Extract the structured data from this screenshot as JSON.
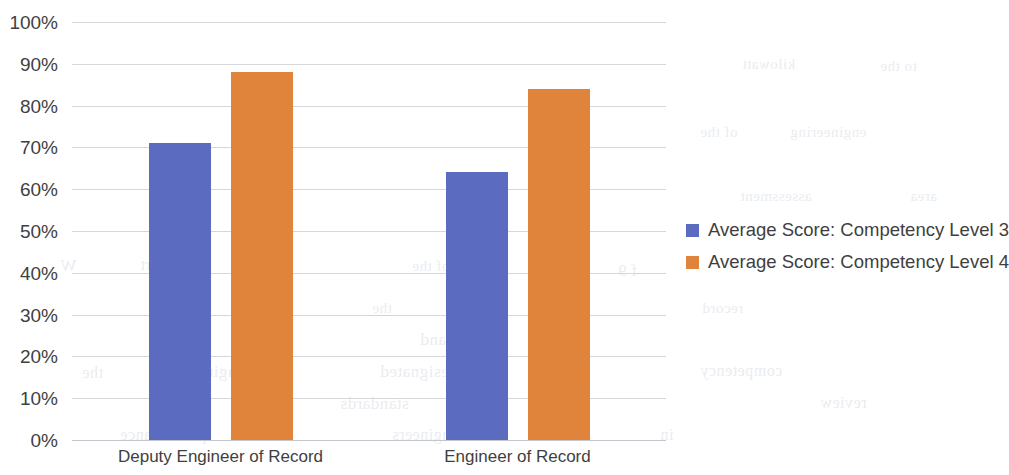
{
  "chart_data": {
    "type": "bar",
    "title": "",
    "subtitle": "",
    "xlabel": "",
    "ylabel": "",
    "categories": [
      "Deputy Engineer of Record",
      "Engineer of Record"
    ],
    "series": [
      {
        "name": "Average Score: Competency Level 3",
        "color": "#5b6bbf",
        "values": [
          71,
          64
        ]
      },
      {
        "name": "Average Score: Competency Level 4",
        "color": "#e0843b",
        "values": [
          88,
          84
        ]
      }
    ],
    "ylim": [
      0,
      100
    ],
    "ytick_labels": [
      "0%",
      "10%",
      "20%",
      "30%",
      "40%",
      "50%",
      "60%",
      "70%",
      "80%",
      "90%",
      "100%"
    ],
    "ytick_values": [
      0,
      10,
      20,
      30,
      40,
      50,
      60,
      70,
      80,
      90,
      100
    ],
    "value_suffix": "%",
    "grid": true,
    "grid_axis": "y",
    "legend_position": "right",
    "legend": [
      "Average Score: Competency Level 3",
      "Average Score: Competency Level 4"
    ],
    "annotations": []
  },
  "background_bleed": [
    {
      "text": "kilowatt",
      "x": 742,
      "y": 56,
      "size": 15
    },
    {
      "text": "to the",
      "x": 880,
      "y": 58,
      "size": 15
    },
    {
      "text": "of the",
      "x": 700,
      "y": 124,
      "size": 15
    },
    {
      "text": "engineering",
      "x": 790,
      "y": 124,
      "size": 15
    },
    {
      "text": "f 9",
      "x": 618,
      "y": 262,
      "size": 16
    },
    {
      "text": "W",
      "x": 60,
      "y": 256,
      "size": 17
    },
    {
      "text": "the report",
      "x": 140,
      "y": 256,
      "size": 16
    },
    {
      "text": "of the",
      "x": 412,
      "y": 258,
      "size": 15
    },
    {
      "text": "the",
      "x": 372,
      "y": 300,
      "size": 15
    },
    {
      "text": "record",
      "x": 702,
      "y": 300,
      "size": 15
    },
    {
      "text": "manner and",
      "x": 420,
      "y": 330,
      "size": 17
    },
    {
      "text": "the",
      "x": 82,
      "y": 364,
      "size": 16
    },
    {
      "text": "engineer",
      "x": 182,
      "y": 362,
      "size": 17
    },
    {
      "text": "designated",
      "x": 380,
      "y": 362,
      "size": 17
    },
    {
      "text": "competency",
      "x": 700,
      "y": 362,
      "size": 16
    },
    {
      "text": "www.",
      "x": 150,
      "y": 394,
      "size": 16
    },
    {
      "text": "standards",
      "x": 340,
      "y": 394,
      "size": 17
    },
    {
      "text": "the",
      "x": 560,
      "y": 394,
      "size": 16
    },
    {
      "text": "review",
      "x": 820,
      "y": 394,
      "size": 16
    },
    {
      "text": "performance",
      "x": 120,
      "y": 426,
      "size": 16
    },
    {
      "text": "of engineers",
      "x": 392,
      "y": 426,
      "size": 16
    },
    {
      "text": "in",
      "x": 660,
      "y": 426,
      "size": 16
    },
    {
      "text": "assessment",
      "x": 740,
      "y": 188,
      "size": 15
    },
    {
      "text": "area",
      "x": 910,
      "y": 188,
      "size": 15
    }
  ]
}
